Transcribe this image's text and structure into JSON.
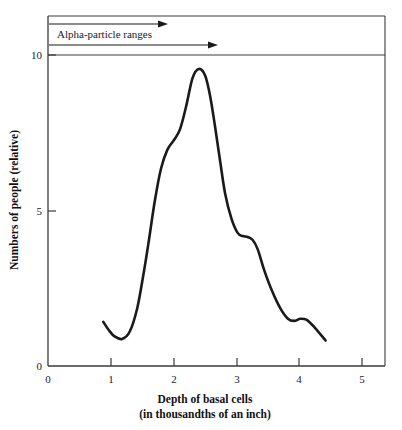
{
  "chart_data": {
    "type": "line",
    "title": "",
    "xlabel": "Depth of basal cells",
    "xlabel_line2": "(in thousandths of an inch)",
    "ylabel": "Numbers of people (relative)",
    "xlim": [
      0,
      5.4
    ],
    "ylim": [
      0,
      10.6
    ],
    "grid": false,
    "legend": "none",
    "xticks": [
      0,
      1,
      2,
      3,
      4,
      5
    ],
    "xtick_labels": [
      "0",
      "1",
      "2",
      "3",
      "4",
      "5"
    ],
    "yticks": [
      0,
      5,
      10
    ],
    "ytick_labels": [
      "0",
      "5",
      "10"
    ],
    "series": [
      {
        "name": "Numbers of people (relative)",
        "x": [
          0.88,
          0.97,
          1.06,
          1.18,
          1.3,
          1.42,
          1.52,
          1.6,
          1.7,
          1.8,
          1.9,
          2.0,
          2.1,
          2.2,
          2.3,
          2.4,
          2.5,
          2.58,
          2.66,
          2.74,
          2.82,
          2.92,
          3.02,
          3.1,
          3.18,
          3.26,
          3.34,
          3.44,
          3.56,
          3.7,
          3.82,
          3.92,
          4.02,
          4.12,
          4.24,
          4.42
        ],
        "y": [
          1.42,
          1.15,
          0.95,
          0.87,
          1.1,
          1.85,
          2.95,
          3.95,
          5.3,
          6.35,
          6.95,
          7.25,
          7.6,
          8.35,
          9.25,
          9.55,
          9.35,
          8.7,
          7.7,
          6.6,
          5.55,
          4.75,
          4.28,
          4.18,
          4.15,
          4.05,
          3.75,
          3.1,
          2.45,
          1.85,
          1.52,
          1.45,
          1.52,
          1.48,
          1.25,
          0.82
        ]
      }
    ],
    "annotations": [
      {
        "name": "alpha-particle-ranges",
        "label": "Alpha-particle ranges",
        "arrows": [
          {
            "x_start": 0.02,
            "x_end": 2.37,
            "y": 10.52
          },
          {
            "x_start": 0.02,
            "x_end": 2.95,
            "y": 10.09
          }
        ]
      }
    ]
  },
  "figure": {
    "annotation_label": "Alpha-particle ranges",
    "x_axis_title_line1": "Depth of basal cells",
    "x_axis_title_line2": "(in thousandths of an inch)",
    "y_axis_title": "Numbers of people (relative)",
    "x_tick_0": "0",
    "x_tick_1": "1",
    "x_tick_2": "2",
    "x_tick_3": "3",
    "x_tick_4": "4",
    "x_tick_5": "5",
    "y_tick_0": "0",
    "y_tick_5": "5",
    "y_tick_10": "10",
    "colors": {
      "curve": "#1a1a1a",
      "axis": "#3a3a3a",
      "background": "#ffffff"
    }
  }
}
